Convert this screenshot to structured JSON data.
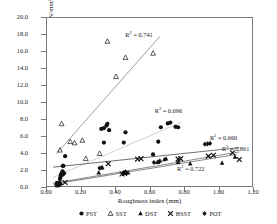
{
  "chart_data": {
    "type": "scatter",
    "title": "",
    "xlabel": "Roughness index (mm)",
    "ylabel": "Shear bond strength (N/mm²)",
    "xlim": [
      0.0,
      1.2
    ],
    "ylim": [
      0.0,
      20.0
    ],
    "xticks": [
      "0.00",
      "0.20",
      "0.40",
      "0.60",
      "0.80",
      "1.00",
      "1.20"
    ],
    "yticks": [
      "0.0",
      "2.0",
      "4.0",
      "6.0",
      "8.0",
      "10.0",
      "12.0",
      "14.0",
      "16.0",
      "18.0",
      "20.0"
    ],
    "grid": false,
    "legend_position": "bottom",
    "legend": [
      "PST",
      "SST",
      "DST",
      "BSST",
      "POT"
    ],
    "annotations": [
      {
        "text": "R² = 0.741",
        "x": 0.46,
        "y": 18.1,
        "series": "SST"
      },
      {
        "text": "R² = 0.696",
        "x": 0.63,
        "y": 9.1,
        "series": "PST"
      },
      {
        "text": "R² = 0.660",
        "x": 0.95,
        "y": 5.9,
        "series": "POT"
      },
      {
        "text": "R² = 0.861",
        "x": 1.02,
        "y": 4.6,
        "series": "BSST"
      },
      {
        "text": "R² = 0.722",
        "x": 0.76,
        "y": 2.3,
        "series": "DST"
      }
    ],
    "series": [
      {
        "name": "PST",
        "marker": "filled-circle",
        "color": "#111111",
        "trendline": {
          "x0": 0.035,
          "y0": 1.25,
          "x1": 0.78,
          "y1": 7.75,
          "color": "#bbbbbb"
        },
        "points": [
          [
            0.055,
            0.35
          ],
          [
            0.06,
            0.42
          ],
          [
            0.065,
            0.5
          ],
          [
            0.058,
            0.62
          ],
          [
            0.07,
            0.55
          ],
          [
            0.062,
            0.3
          ],
          [
            0.075,
            1.05
          ],
          [
            0.08,
            1.55
          ],
          [
            0.085,
            1.72
          ],
          [
            0.09,
            1.95
          ],
          [
            0.078,
            1.3
          ],
          [
            0.095,
            2.6
          ],
          [
            0.105,
            3.75
          ],
          [
            0.315,
            6.95
          ],
          [
            0.33,
            7.05
          ],
          [
            0.345,
            7.35
          ],
          [
            0.35,
            7.55
          ],
          [
            0.36,
            6.8
          ],
          [
            0.33,
            5.35
          ],
          [
            0.445,
            5.35
          ],
          [
            0.455,
            6.55
          ],
          [
            0.645,
            5.45
          ],
          [
            0.66,
            7.15
          ],
          [
            0.7,
            7.6
          ],
          [
            0.715,
            7.7
          ],
          [
            0.745,
            7.2
          ],
          [
            0.76,
            7.15
          ],
          [
            0.615,
            3.95
          ]
        ]
      },
      {
        "name": "SST",
        "marker": "open-triangle",
        "color": "#111111",
        "trendline": {
          "x0": 0.055,
          "y0": 4.05,
          "x1": 0.655,
          "y1": 17.85,
          "color": "#777777"
        },
        "points": [
          [
            0.075,
            4.45
          ],
          [
            0.085,
            7.55
          ],
          [
            0.135,
            5.45
          ],
          [
            0.16,
            5.3
          ],
          [
            0.205,
            5.6
          ],
          [
            0.225,
            3.45
          ],
          [
            0.35,
            17.25
          ],
          [
            0.4,
            13.1
          ],
          [
            0.455,
            15.35
          ],
          [
            0.615,
            15.85
          ],
          [
            0.305,
            4.05
          ]
        ]
      },
      {
        "name": "DST",
        "marker": "filled-triangle",
        "color": "#111111",
        "trendline": {
          "x0": 0.035,
          "y0": 0.45,
          "x1": 1.1,
          "y1": 3.95,
          "color": "#555555"
        },
        "points": [
          [
            0.06,
            0.3
          ],
          [
            0.068,
            0.38
          ],
          [
            0.072,
            0.45
          ],
          [
            0.08,
            0.55
          ],
          [
            0.3,
            1.8
          ],
          [
            0.315,
            2.35
          ],
          [
            0.32,
            2.45
          ],
          [
            0.455,
            1.75
          ],
          [
            0.47,
            1.8
          ],
          [
            0.64,
            3.05
          ],
          [
            0.655,
            3.2
          ],
          [
            0.68,
            3.35
          ],
          [
            0.69,
            3.45
          ],
          [
            0.76,
            3.05
          ],
          [
            0.83,
            2.85
          ],
          [
            1.015,
            2.95
          ],
          [
            1.09,
            3.65
          ]
        ]
      },
      {
        "name": "BSST",
        "marker": "x-cross",
        "color": "#111111",
        "trendline": {
          "x0": 0.035,
          "y0": 0.55,
          "x1": 1.115,
          "y1": 4.25,
          "color": "#555555"
        },
        "points": [
          [
            0.105,
            0.65
          ],
          [
            0.435,
            1.65
          ],
          [
            0.45,
            1.7
          ],
          [
            0.355,
            2.85
          ],
          [
            0.525,
            3.4
          ],
          [
            0.545,
            3.45
          ],
          [
            0.76,
            3.4
          ],
          [
            0.775,
            3.45
          ],
          [
            0.935,
            3.75
          ],
          [
            0.965,
            3.85
          ],
          [
            1.075,
            4.15
          ],
          [
            1.115,
            3.35
          ]
        ]
      },
      {
        "name": "POT",
        "marker": "filled-diamond",
        "color": "#111111",
        "trendline": {
          "x0": 0.035,
          "y0": 2.45,
          "x1": 1.115,
          "y1": 4.75,
          "color": "#333333"
        },
        "points": [
          [
            0.058,
            0.4
          ],
          [
            0.066,
            0.48
          ],
          [
            0.074,
            0.55
          ],
          [
            0.086,
            1.55
          ],
          [
            0.095,
            1.62
          ],
          [
            0.1,
            1.75
          ],
          [
            0.09,
            2.6
          ],
          [
            0.305,
            2.35
          ],
          [
            0.445,
            1.8
          ],
          [
            0.455,
            1.9
          ],
          [
            0.62,
            3.0
          ],
          [
            0.65,
            3.1
          ],
          [
            0.93,
            5.2
          ],
          [
            0.945,
            5.25
          ],
          [
            0.915,
            5.15
          ]
        ]
      }
    ]
  },
  "legend": {
    "items": [
      {
        "label": "PST",
        "glyph": "filled-circle-icon"
      },
      {
        "label": "SST",
        "glyph": "open-triangle-icon"
      },
      {
        "label": "DST",
        "glyph": "filled-triangle-icon"
      },
      {
        "label": "BSST",
        "glyph": "x-cross-icon"
      },
      {
        "label": "POT",
        "glyph": "filled-diamond-icon"
      }
    ]
  },
  "axes": {
    "x_title": "Roughness index (mm)",
    "y_title": "Shear bond strength (N/mm²)"
  },
  "colors": {
    "frame": "#7a7a7a",
    "marker": "#111111",
    "text": "#1a1a1a"
  }
}
